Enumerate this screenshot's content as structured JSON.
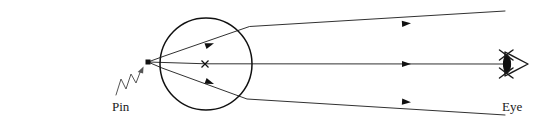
{
  "diagram": {
    "type": "ray-optics-diagram",
    "title": "",
    "background_color": "#ffffff",
    "stroke_color": "#111111",
    "canvas": {
      "width": 554,
      "height": 123
    },
    "labels": {
      "pin": "Pin",
      "eye": "Eye"
    },
    "icons": {
      "pin_point": "pin-point-marker",
      "center_mark": "center-cross-mark",
      "eye_symbol": "eye-icon",
      "pointer": "squiggly-pointer-arrow",
      "arrowheads": "ray-direction-arrowhead"
    },
    "elements": {
      "lens": {
        "name": "spherical-lens",
        "shape": "circle",
        "cx": 206,
        "cy": 64,
        "r": 46
      },
      "pin": {
        "name": "pin-object",
        "x": 148,
        "y": 62
      },
      "center": {
        "name": "lens-center",
        "x": 205,
        "y": 64
      },
      "eye": {
        "name": "observer-eye",
        "x": 512,
        "y": 64
      },
      "rays": [
        {
          "name": "upper-ray",
          "points": "148,62 163,57 249,27 505,11",
          "arrow_positions": [
            {
              "x": 212,
              "y": 44,
              "angle": -19
            },
            {
              "x": 409,
              "y": 23,
              "angle": -3.6
            }
          ]
        },
        {
          "name": "axis-ray",
          "points": "148,62 206,64 505,64",
          "arrow_positions": [
            {
              "x": 409,
              "y": 64,
              "angle": 0
            }
          ]
        },
        {
          "name": "lower-ray",
          "points": "148,62 162,68 247,99 505,115",
          "arrow_positions": [
            {
              "x": 212,
              "y": 83,
              "angle": 20
            },
            {
              "x": 409,
              "y": 102,
              "angle": 3.6
            }
          ]
        }
      ]
    }
  }
}
